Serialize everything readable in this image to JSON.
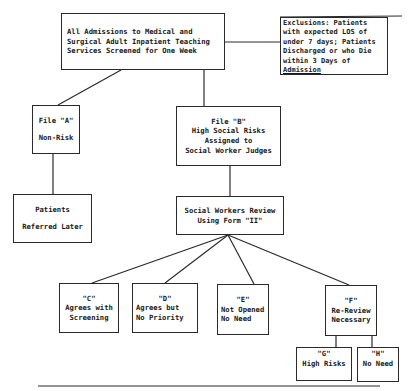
{
  "diagram": {
    "type": "flowchart",
    "nodes": {
      "root": {
        "lines": [
          "All Admissions to Medical and",
          "Surgical Adult Inpatient Teaching",
          "Services Screened for One Week"
        ]
      },
      "exclusions": {
        "lines": [
          "Exclusions: Patients",
          "with expected LOS of",
          "under 7 days; Patients",
          "Discharged or who Die",
          "within 3 Days of",
          "Admission"
        ]
      },
      "file_a": {
        "lines": [
          "File \"A\"",
          "Non-Risk"
        ]
      },
      "file_b": {
        "lines": [
          "File \"B\"",
          "High Social Risks",
          "Assigned to",
          "Social Worker Judges"
        ]
      },
      "patients_referred": {
        "lines": [
          "Patients",
          "Referred Later"
        ]
      },
      "social_workers_review": {
        "lines": [
          "Social Workers Review",
          "Using Form \"II\""
        ]
      },
      "c": {
        "lines": [
          "\"C\"",
          "Agrees with",
          "Screening"
        ]
      },
      "d": {
        "lines": [
          "\"D\"",
          "Agrees but",
          "No Priority"
        ]
      },
      "e": {
        "lines": [
          "\"E\"",
          "Not Opened",
          "No Need"
        ]
      },
      "f": {
        "lines": [
          "\"F\"",
          "Re-Review",
          "Necessary"
        ]
      },
      "g": {
        "lines": [
          "\"G\"",
          "High Risks"
        ]
      },
      "h": {
        "lines": [
          "\"H\"",
          "No Need"
        ]
      }
    },
    "edges": [
      {
        "from": "root",
        "to": "exclusions"
      },
      {
        "from": "root",
        "to": "file_a"
      },
      {
        "from": "root",
        "to": "file_b"
      },
      {
        "from": "file_a",
        "to": "patients_referred"
      },
      {
        "from": "file_b",
        "to": "social_workers_review"
      },
      {
        "from": "social_workers_review",
        "to": "c"
      },
      {
        "from": "social_workers_review",
        "to": "d"
      },
      {
        "from": "social_workers_review",
        "to": "e"
      },
      {
        "from": "social_workers_review",
        "to": "f"
      },
      {
        "from": "f",
        "to": "g"
      },
      {
        "from": "f",
        "to": "h"
      }
    ],
    "colors": {
      "line": "#2a2a2a",
      "text": "#1a1a1a",
      "background": "#ffffff"
    }
  }
}
